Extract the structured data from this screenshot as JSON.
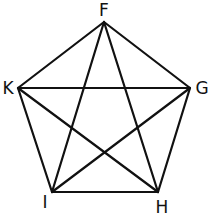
{
  "diagram": {
    "type": "complete-graph-pentagon",
    "vertices": [
      {
        "id": "F",
        "label": "F",
        "x": 104,
        "y": 22,
        "lx": 104,
        "ly": 16
      },
      {
        "id": "G",
        "label": "G",
        "x": 190,
        "y": 88,
        "lx": 202,
        "ly": 94
      },
      {
        "id": "H",
        "label": "H",
        "x": 158,
        "y": 192,
        "lx": 162,
        "ly": 213
      },
      {
        "id": "I",
        "label": "I",
        "x": 52,
        "y": 192,
        "lx": 45,
        "ly": 208
      },
      {
        "id": "K",
        "label": "K",
        "x": 18,
        "y": 88,
        "lx": 8,
        "ly": 94
      }
    ],
    "edges": [
      [
        "F",
        "G"
      ],
      [
        "G",
        "H"
      ],
      [
        "H",
        "I"
      ],
      [
        "I",
        "K"
      ],
      [
        "K",
        "F"
      ],
      [
        "F",
        "H"
      ],
      [
        "F",
        "I"
      ],
      [
        "G",
        "I"
      ],
      [
        "G",
        "K"
      ],
      [
        "H",
        "K"
      ]
    ],
    "colors": {
      "line": "#111111",
      "background": "#ffffff"
    }
  }
}
